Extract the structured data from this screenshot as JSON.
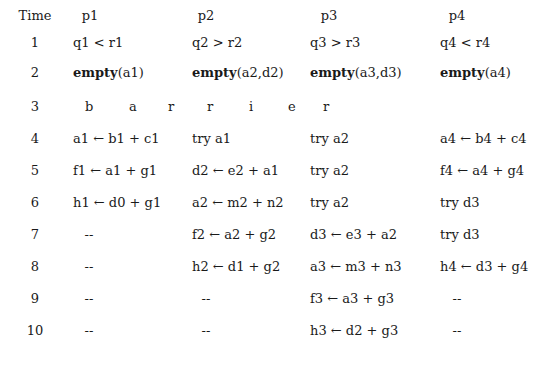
{
  "table": {
    "headers": [
      {
        "label": "Time"
      },
      {
        "base": "p",
        "sub": "1"
      },
      {
        "base": "p",
        "sub": "2"
      },
      {
        "base": "p",
        "sub": "3"
      },
      {
        "base": "p",
        "sub": "4"
      }
    ],
    "rows": [
      {
        "time": "1",
        "cells": [
          [
            {
              "t": "q"
            },
            {
              "s": "1"
            },
            {
              "t": " < r"
            },
            {
              "s": "1"
            }
          ],
          [
            {
              "t": "q"
            },
            {
              "s": "2"
            },
            {
              "t": " > r"
            },
            {
              "s": "2"
            }
          ],
          [
            {
              "t": "q"
            },
            {
              "s": "3"
            },
            {
              "t": " > r"
            },
            {
              "s": "3"
            }
          ],
          [
            {
              "t": "q"
            },
            {
              "s": "4"
            },
            {
              "t": " < r"
            },
            {
              "s": "4"
            }
          ]
        ]
      },
      {
        "time": "2",
        "cells": [
          [
            {
              "b": "empty"
            },
            {
              "t": "(a"
            },
            {
              "s": "1"
            },
            {
              "t": ")"
            }
          ],
          [
            {
              "b": "empty"
            },
            {
              "t": "(a"
            },
            {
              "s": "2"
            },
            {
              "t": ",d"
            },
            {
              "s": "2"
            },
            {
              "t": ")"
            }
          ],
          [
            {
              "b": "empty"
            },
            {
              "t": "(a"
            },
            {
              "s": "3"
            },
            {
              "t": ",d"
            },
            {
              "s": "3"
            },
            {
              "t": ")"
            }
          ],
          [
            {
              "b": "empty"
            },
            {
              "t": "(a"
            },
            {
              "s": "4"
            },
            {
              "t": ")"
            }
          ]
        ]
      },
      {
        "time": "3",
        "barrier": [
          "b",
          "a",
          "r",
          "r",
          "i",
          "e",
          "r"
        ]
      },
      {
        "time": "4",
        "cells": [
          [
            {
              "t": "a"
            },
            {
              "s": "1"
            },
            {
              "t": " ← b"
            },
            {
              "s": "1"
            },
            {
              "t": " +  c"
            },
            {
              "s": "1"
            }
          ],
          [
            {
              "t": "try a"
            },
            {
              "s": "1"
            }
          ],
          [
            {
              "t": "try a"
            },
            {
              "s": "2"
            }
          ],
          [
            {
              "t": "a"
            },
            {
              "s": "4"
            },
            {
              "t": " ← b"
            },
            {
              "s": "4"
            },
            {
              "t": " +  c"
            },
            {
              "s": "4"
            }
          ]
        ]
      },
      {
        "time": "5",
        "cells": [
          [
            {
              "t": "f"
            },
            {
              "s": "1"
            },
            {
              "t": " ← a"
            },
            {
              "s": "1"
            },
            {
              "t": " +  g"
            },
            {
              "s": "1"
            }
          ],
          [
            {
              "t": "d"
            },
            {
              "s": "2"
            },
            {
              "t": " ← e"
            },
            {
              "s": "2"
            },
            {
              "t": " +  a"
            },
            {
              "s": "1"
            }
          ],
          [
            {
              "t": "try a"
            },
            {
              "s": "2"
            }
          ],
          [
            {
              "t": "f"
            },
            {
              "s": "4"
            },
            {
              "t": " ← a"
            },
            {
              "s": "4"
            },
            {
              "t": " +  g"
            },
            {
              "s": "4"
            }
          ]
        ]
      },
      {
        "time": "6",
        "cells": [
          [
            {
              "t": "h"
            },
            {
              "s": "1"
            },
            {
              "t": " ← d"
            },
            {
              "s": "0"
            },
            {
              "t": " +  g"
            },
            {
              "s": "1"
            }
          ],
          [
            {
              "t": "a"
            },
            {
              "s": "2"
            },
            {
              "t": " ← m"
            },
            {
              "s": "2"
            },
            {
              "t": " +  n"
            },
            {
              "s": "2"
            }
          ],
          [
            {
              "t": "try a"
            },
            {
              "s": "2"
            }
          ],
          [
            {
              "t": "try d"
            },
            {
              "s": "3"
            }
          ]
        ]
      },
      {
        "time": "7",
        "cells": [
          [
            {
              "t": "--"
            }
          ],
          [
            {
              "t": "f"
            },
            {
              "s": "2"
            },
            {
              "t": " ← a"
            },
            {
              "s": "2"
            },
            {
              "t": " +  g"
            },
            {
              "s": "2"
            }
          ],
          [
            {
              "t": "d"
            },
            {
              "s": "3"
            },
            {
              "t": " ← e"
            },
            {
              "s": "3"
            },
            {
              "t": " +  a"
            },
            {
              "s": "2"
            }
          ],
          [
            {
              "t": "try d"
            },
            {
              "s": "3"
            }
          ]
        ]
      },
      {
        "time": "8",
        "cells": [
          [
            {
              "t": "--"
            }
          ],
          [
            {
              "t": "h"
            },
            {
              "s": "2"
            },
            {
              "t": " ← d"
            },
            {
              "s": "1"
            },
            {
              "t": " +  g"
            },
            {
              "s": "2"
            }
          ],
          [
            {
              "t": "a"
            },
            {
              "s": "3"
            },
            {
              "t": " ← m"
            },
            {
              "s": "3"
            },
            {
              "t": " +  n"
            },
            {
              "s": "3"
            }
          ],
          [
            {
              "t": "h"
            },
            {
              "s": "4"
            },
            {
              "t": " ← d"
            },
            {
              "s": "3"
            },
            {
              "t": " +  g"
            },
            {
              "s": "4"
            }
          ]
        ]
      },
      {
        "time": "9",
        "cells": [
          [
            {
              "t": "--"
            }
          ],
          [
            {
              "t": "--"
            }
          ],
          [
            {
              "t": "f"
            },
            {
              "s": "3"
            },
            {
              "t": " ← a"
            },
            {
              "s": "3"
            },
            {
              "t": " +  g"
            },
            {
              "s": "3"
            }
          ],
          [
            {
              "t": "--"
            }
          ]
        ]
      },
      {
        "time": "10",
        "cells": [
          [
            {
              "t": "--"
            }
          ],
          [
            {
              "t": "--"
            }
          ],
          [
            {
              "t": "h"
            },
            {
              "s": "3"
            },
            {
              "t": " ← d"
            },
            {
              "s": "2"
            },
            {
              "t": " +  g"
            },
            {
              "s": "3"
            }
          ],
          [
            {
              "t": "--"
            }
          ]
        ]
      }
    ]
  }
}
